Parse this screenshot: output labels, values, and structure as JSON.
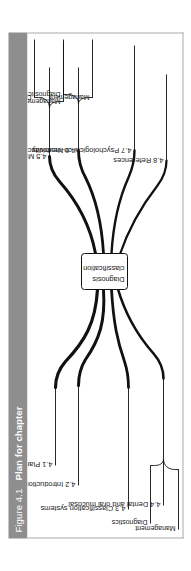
{
  "figure": {
    "number": "Figure 4.1",
    "caption": "Plan for chapter"
  },
  "diagram": {
    "type": "mind-map",
    "center": {
      "line1": "Diagnosis",
      "line2": "classification"
    },
    "branches": [
      {
        "id": "4.1",
        "label": "4.1 Plan",
        "children": []
      },
      {
        "id": "4.2",
        "label": "4.2 Introduction",
        "children": []
      },
      {
        "id": "4.3",
        "label": "4.3 Classification systems",
        "children": []
      },
      {
        "id": "4.4",
        "label": "4.4 Dental and oral mucosal",
        "children": [
          "Diagnostics",
          "Management"
        ]
      },
      {
        "id": "4.5",
        "label": "4.5 Musculoskeletal",
        "children": [
          "Diagnostics",
          "Management"
        ]
      },
      {
        "id": "4.6",
        "label": "4.6 Neurovascular",
        "children": [
          "Diagnostics",
          "Management"
        ]
      },
      {
        "id": "4.7",
        "label": "4.7 Psychological co-morbidity",
        "children": []
      },
      {
        "id": "4.8",
        "label": "4.8 References",
        "children": []
      }
    ],
    "labels": {
      "b1": "4.1 Plan",
      "b2": "4.2 Introduction",
      "b3": "4.3 Classification systems",
      "b4": "4.4 Dental and oral mucosal",
      "b5": "4.5 Musculoskeletal",
      "b6": "4.6 Neurovascular",
      "b7": "4.7 Psychological co-morbidity",
      "b8": "4.8 References",
      "b4_diagnostics": "Diagnostics",
      "b4_management": "Management",
      "b5_diagnostics": "Diagnostics",
      "b5_management": "Management",
      "b6_diagnostics": "Diagnostics",
      "b6_management": "Management"
    },
    "colors": {
      "title_bar": "#8e8e8e",
      "title_text": "#ffffff",
      "frame_border": "#a9a9a9",
      "branch_stroke": "#111111",
      "background": "#ffffff"
    }
  }
}
